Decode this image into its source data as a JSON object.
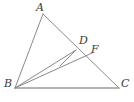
{
  "figure": {
    "background_color": "#ffffff",
    "line_color": "#8a8a8a",
    "label_color": "#3a3a3a",
    "width": 134,
    "height": 102,
    "points": {
      "A": {
        "label": "A",
        "x": 43,
        "y": 14,
        "label_x": 36,
        "label_y": 2
      },
      "B": {
        "label": "B",
        "x": 15,
        "y": 88,
        "label_x": 4,
        "label_y": 78
      },
      "C": {
        "label": "C",
        "x": 119,
        "y": 88,
        "label_x": 121,
        "label_y": 78
      },
      "D": {
        "label": "D",
        "x": 76,
        "y": 50,
        "label_x": 79,
        "label_y": 35
      },
      "F": {
        "label": "F",
        "x": 88,
        "y": 57,
        "label_x": 91,
        "label_y": 44
      }
    },
    "segments": [
      {
        "name": "segment-AB",
        "from": "A",
        "to": "B"
      },
      {
        "name": "segment-AC",
        "from": "A",
        "to": "C"
      },
      {
        "name": "segment-BC",
        "from": "B",
        "to": "C"
      },
      {
        "name": "segment-BD",
        "from": "B",
        "to": "D"
      },
      {
        "name": "segment-BF",
        "from": "B",
        "to": "F"
      },
      {
        "name": "segment-DE",
        "from": "D",
        "to": "E"
      }
    ],
    "labels_order": [
      "A",
      "D",
      "F",
      "B",
      "C"
    ]
  }
}
